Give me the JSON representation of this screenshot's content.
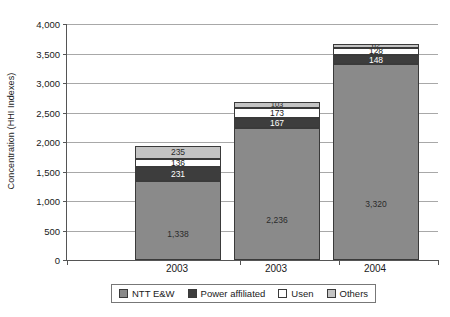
{
  "chart_data": {
    "type": "bar",
    "subtype": "stacked-bar",
    "title": "",
    "xlabel": "",
    "ylabel": "Concentration (HHI Indexes)",
    "categories": [
      "2003",
      "2003",
      "2004"
    ],
    "ylim": [
      0,
      4000
    ],
    "ytick_step": 500,
    "ytick_labels": [
      "0",
      "500",
      "1,000",
      "1,500",
      "2,000",
      "2,500",
      "3,000",
      "3,500",
      "4,000"
    ],
    "ytick_values": [
      0,
      500,
      1000,
      1500,
      2000,
      2500,
      3000,
      3500,
      4000
    ],
    "grid": true,
    "legend_position": "bottom",
    "series": [
      {
        "name": "NTT E&W",
        "color": "#8a8a8a",
        "values": [
          1338,
          2236,
          3320
        ],
        "labels": [
          "1,338",
          "2,236",
          "3,320"
        ]
      },
      {
        "name": "Power affiliated",
        "color": "#3d3d3d",
        "values": [
          231,
          167,
          148
        ],
        "labels": [
          "231",
          "167",
          "148"
        ]
      },
      {
        "name": "Usen",
        "color": "#ffffff",
        "values": [
          136,
          173,
          128
        ],
        "labels": [
          "136",
          "173",
          "128"
        ]
      },
      {
        "name": "Others",
        "color": "#c4c4c4",
        "values": [
          235,
          103,
          62
        ],
        "labels": [
          "235",
          "103",
          "62"
        ]
      }
    ],
    "totals": [
      1940,
      2679,
      3658
    ]
  },
  "legend": {
    "items": [
      {
        "label": "NTT E&W",
        "color": "#8a8a8a"
      },
      {
        "label": "Power affiliated",
        "color": "#3d3d3d"
      },
      {
        "label": "Usen",
        "color": "#ffffff"
      },
      {
        "label": "Others",
        "color": "#c4c4c4"
      }
    ]
  }
}
